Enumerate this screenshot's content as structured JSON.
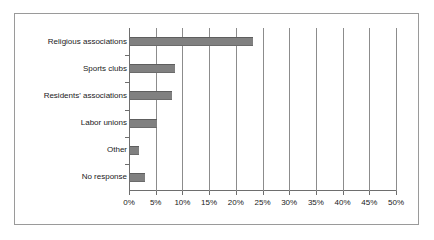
{
  "chart_data": {
    "type": "bar",
    "orientation": "horizontal",
    "title": "",
    "subtitle": "",
    "xlabel": "",
    "ylabel": "",
    "categories": [
      "Religious associations",
      "Sports clubs",
      "Residents' associations",
      "Labor unions",
      "Other",
      "No response"
    ],
    "values": [
      23.0,
      8.5,
      7.8,
      5.0,
      1.7,
      2.8
    ],
    "xlim": [
      0,
      50
    ],
    "xtick_values": [
      0,
      5,
      10,
      15,
      20,
      25,
      30,
      35,
      40,
      45,
      50
    ],
    "xtick_labels": [
      "0%",
      "5%",
      "10%",
      "15%",
      "20%",
      "25%",
      "30%",
      "35%",
      "40%",
      "45%",
      "50%"
    ],
    "grid": "vertical",
    "legend": "none",
    "series": [
      {
        "name": "Share of respondents",
        "values": [
          23.0,
          8.5,
          7.8,
          5.0,
          1.7,
          2.8
        ]
      }
    ],
    "colors": {
      "bar_fill": "#808080",
      "bar_edge": "#5e5e5e",
      "gridline": "#8c8c8c",
      "axis": "#6e6e6e",
      "frame": "#9a9a9a",
      "background": "#ffffff",
      "text": "#1a1a1a"
    }
  }
}
